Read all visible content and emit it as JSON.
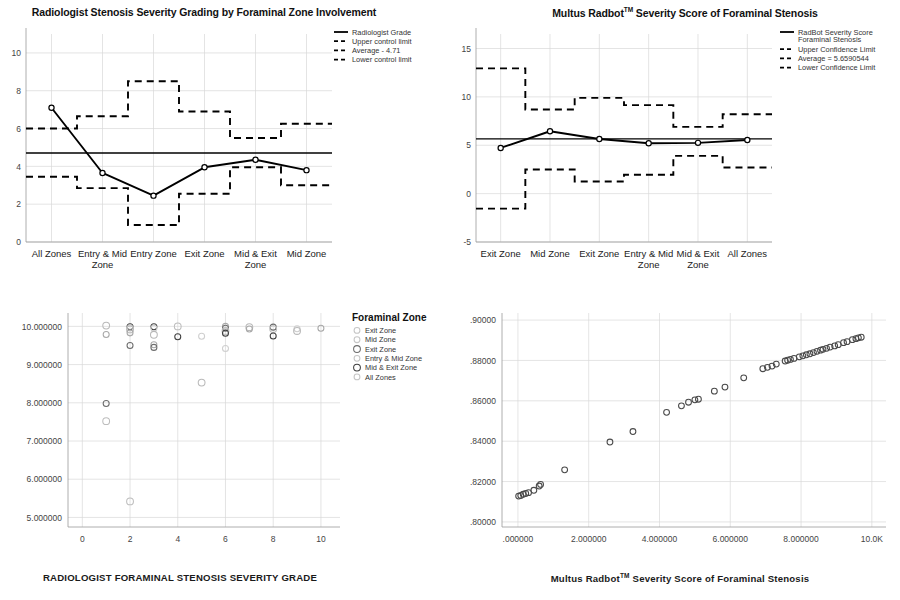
{
  "chart_data": [
    {
      "id": "radiologist-control-chart",
      "type": "line",
      "title": "Radiologist Stenosis Severity Grading by Foraminal Zone Involvement",
      "xlabel": "",
      "ylabel": "",
      "ylim": [
        0,
        11
      ],
      "yticks": [
        "0",
        "2",
        "4",
        "6",
        "8",
        "10"
      ],
      "ytickvals": [
        0,
        2,
        4,
        6,
        8,
        10
      ],
      "grid": true,
      "legend_position": "top-right",
      "categories": [
        "All Zones",
        "Entry & Mid Zone",
        "Entry Zone",
        "Exit Zone",
        "Mid & Exit Zone",
        "Mid Zone"
      ],
      "series": [
        {
          "name": "Radiologist Grade",
          "style": "solid",
          "values": [
            7.1,
            3.65,
            2.45,
            3.95,
            4.35,
            3.8
          ]
        },
        {
          "name": "Upper control limit",
          "style": "dashed-step",
          "values": [
            6.0,
            6.65,
            8.5,
            6.9,
            5.5,
            6.25
          ]
        },
        {
          "name": "Average - 4.71",
          "style": "solid-flat",
          "values": [
            4.71,
            4.71,
            4.71,
            4.71,
            4.71,
            4.71
          ]
        },
        {
          "name": "Lower control limit",
          "style": "dashed-step",
          "values": [
            3.45,
            2.85,
            0.9,
            2.55,
            3.95,
            3.0
          ]
        }
      ],
      "legend": [
        "Radiologist Grade",
        "Upper control limit",
        "Average - 4.71",
        "Lower control limit"
      ]
    },
    {
      "id": "radbot-control-chart",
      "type": "line",
      "title_prefix": "Multus Radbot",
      "title_sup": "TM",
      "title_suffix": " Severity Score of Foraminal Stenosis",
      "title": "Multus Radbot™ Severity Score of Foraminal Stenosis",
      "xlabel": "",
      "ylabel": "",
      "ylim": [
        -5,
        16.5
      ],
      "yticks": [
        "-5",
        "0",
        "5",
        "10",
        "15"
      ],
      "ytickvals": [
        -5,
        0,
        5,
        10,
        15
      ],
      "grid": true,
      "legend_position": "top-right",
      "categories": [
        "Exit Zone",
        "Mid Zone",
        "Exit Zone",
        "Entry & Mid Zone",
        "Mid & Exit Zone",
        "All Zones"
      ],
      "series": [
        {
          "name": "RadBot Severity Score Foraminal Stenosis",
          "style": "solid",
          "values": [
            4.72,
            6.45,
            5.65,
            5.2,
            5.25,
            5.55
          ]
        },
        {
          "name": "Upper Confidence Limit",
          "style": "dashed-step",
          "values": [
            12.95,
            8.7,
            9.9,
            9.15,
            6.9,
            8.2
          ]
        },
        {
          "name": "Average = 5.6590544",
          "style": "solid-flat",
          "values": [
            5.659,
            5.659,
            5.659,
            5.659,
            5.659,
            5.659
          ]
        },
        {
          "name": "Lower Confidence Limit",
          "style": "dashed-step",
          "values": [
            -1.55,
            2.5,
            1.25,
            1.95,
            3.9,
            2.7
          ]
        }
      ],
      "legend": [
        "RadBot Severity Score Foraminal Stenosis",
        "Upper Confidence Limit",
        "Average = 5.6590544",
        "Lower Confidence Limit"
      ]
    },
    {
      "id": "radiologist-grade-scatter",
      "type": "scatter",
      "title": "",
      "xlabel": "RADIOLOGIST FORAMINAL STENOSIS SEVERITY GRADE",
      "ylabel": "",
      "xlim": [
        -0.6,
        10.8
      ],
      "ylim": [
        4.75,
        10.35
      ],
      "xticks": [
        "0",
        "2",
        "4",
        "6",
        "8",
        "10"
      ],
      "xtickvals": [
        0,
        2,
        4,
        6,
        8,
        10
      ],
      "yticks": [
        "5.000000",
        "6.000000",
        "7.000000",
        "8.000000",
        "9.000000",
        "10.000000"
      ],
      "ytickvals": [
        5,
        6,
        7,
        8,
        9,
        10
      ],
      "grid": true,
      "legend_title": "Foraminal Zone",
      "legend": [
        "Exit Zone",
        "Mid Zone",
        "Exit Zone",
        "Entry & Mid Zone",
        "Mid & Exit Zone",
        "All Zones"
      ],
      "points": [
        [
          1,
          10.02
        ],
        [
          1,
          9.79
        ],
        [
          1,
          7.98
        ],
        [
          1,
          7.52
        ],
        [
          2,
          9.99
        ],
        [
          2,
          9.96
        ],
        [
          2,
          9.92
        ],
        [
          2,
          9.83
        ],
        [
          2,
          9.5
        ],
        [
          2,
          5.42
        ],
        [
          3,
          9.99
        ],
        [
          3,
          9.95
        ],
        [
          3,
          9.78
        ],
        [
          3,
          9.52
        ],
        [
          3,
          9.45
        ],
        [
          4,
          10.0
        ],
        [
          4,
          9.73
        ],
        [
          5,
          9.74
        ],
        [
          5,
          8.53
        ],
        [
          6,
          10.0
        ],
        [
          6,
          9.95
        ],
        [
          6,
          9.88
        ],
        [
          6,
          9.82
        ],
        [
          6,
          9.42
        ],
        [
          7,
          9.98
        ],
        [
          7,
          9.93
        ],
        [
          8,
          9.98
        ],
        [
          8,
          9.93
        ],
        [
          8,
          9.75
        ],
        [
          9,
          9.94
        ],
        [
          9,
          9.88
        ],
        [
          10,
          9.95
        ]
      ]
    },
    {
      "id": "radbot-score-scatter",
      "type": "scatter",
      "title": "",
      "xlabel_prefix": "Multus Radbot",
      "xlabel_sup": "TM",
      "xlabel_suffix": " Severity Score of Foraminal Stenosis",
      "xlabel": "Multus Radbot™ Severity Score of Foraminal Stenosis",
      "ylabel": "",
      "xlim": [
        -0.45,
        10.4
      ],
      "ylim": [
        0.7975,
        0.9035
      ],
      "xticks": [
        ".000000",
        "2.000000",
        "4.000000",
        "6.000000",
        "8.000000",
        "10.0K"
      ],
      "xtickvals": [
        0,
        2,
        4,
        6,
        8,
        10
      ],
      "yticks": [
        ".80000",
        ".82000",
        ".84000",
        ".86000",
        ".88000",
        ".90000"
      ],
      "ytickvals": [
        0.8,
        0.82,
        0.84,
        0.86,
        0.88,
        0.9
      ],
      "grid": true,
      "points": [
        [
          0.02,
          0.8128
        ],
        [
          0.08,
          0.8131
        ],
        [
          0.15,
          0.8137
        ],
        [
          0.22,
          0.8141
        ],
        [
          0.3,
          0.8145
        ],
        [
          0.45,
          0.8157
        ],
        [
          0.6,
          0.8178
        ],
        [
          0.64,
          0.8186
        ],
        [
          1.32,
          0.8258
        ],
        [
          2.6,
          0.8396
        ],
        [
          3.25,
          0.8448
        ],
        [
          4.2,
          0.8543
        ],
        [
          4.62,
          0.8575
        ],
        [
          4.82,
          0.8593
        ],
        [
          5.0,
          0.8605
        ],
        [
          5.1,
          0.8608
        ],
        [
          5.55,
          0.8648
        ],
        [
          5.85,
          0.8668
        ],
        [
          6.38,
          0.8714
        ],
        [
          6.92,
          0.8759
        ],
        [
          7.05,
          0.8766
        ],
        [
          7.18,
          0.8772
        ],
        [
          7.3,
          0.8782
        ],
        [
          7.55,
          0.8797
        ],
        [
          7.62,
          0.8801
        ],
        [
          7.7,
          0.8805
        ],
        [
          7.8,
          0.881
        ],
        [
          7.95,
          0.8818
        ],
        [
          8.05,
          0.8823
        ],
        [
          8.15,
          0.8828
        ],
        [
          8.25,
          0.8833
        ],
        [
          8.35,
          0.8839
        ],
        [
          8.45,
          0.8845
        ],
        [
          8.55,
          0.8851
        ],
        [
          8.62,
          0.8855
        ],
        [
          8.72,
          0.886
        ],
        [
          8.82,
          0.8866
        ],
        [
          8.95,
          0.8872
        ],
        [
          9.05,
          0.8878
        ],
        [
          9.2,
          0.8888
        ],
        [
          9.3,
          0.8893
        ],
        [
          9.45,
          0.8903
        ],
        [
          9.55,
          0.8908
        ],
        [
          9.62,
          0.8912
        ],
        [
          9.7,
          0.8915
        ]
      ]
    }
  ]
}
